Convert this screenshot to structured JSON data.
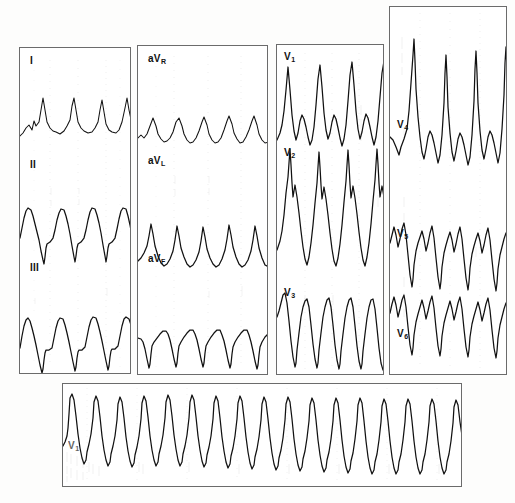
{
  "document": {
    "type": "12-lead electrocardiogram scan",
    "background_color": "#fdfdfc",
    "trace_color": "#111111",
    "panel_border_color": "#6b6b6b",
    "grid_color": "#b9b9b9"
  },
  "panels": [
    {
      "id": "limb-leads",
      "name": "panel-limb-leads",
      "x": 19,
      "y": 47,
      "width": 112,
      "height": 327,
      "leads": [
        {
          "label": "I",
          "sub": "",
          "label_x": 10,
          "label_y": 8,
          "strip_y": 75
        },
        {
          "label": "II",
          "sub": "",
          "label_x": 10,
          "label_y": 112,
          "strip_y": 185
        },
        {
          "label": "III",
          "sub": "",
          "label_x": 10,
          "label_y": 215,
          "strip_y": 285
        }
      ]
    },
    {
      "id": "augmented-leads",
      "name": "panel-augmented-leads",
      "x": 137,
      "y": 45,
      "width": 131,
      "height": 330,
      "leads": [
        {
          "label": "aV",
          "sub": "R",
          "label_x": 10,
          "label_y": 8,
          "strip_y": 82
        },
        {
          "label": "aV",
          "sub": "L",
          "label_x": 10,
          "label_y": 110,
          "strip_y": 190
        },
        {
          "label": "aV",
          "sub": "F",
          "label_x": 10,
          "label_y": 208,
          "strip_y": 288
        }
      ]
    },
    {
      "id": "precordial-leads-v1-v3",
      "name": "panel-precordial-v1-v3",
      "x": 276,
      "y": 44,
      "width": 108,
      "height": 331,
      "leads": [
        {
          "label": "V",
          "sub": "1",
          "label_x": 7,
          "label_y": 7,
          "strip_y": 78
        },
        {
          "label": "V",
          "sub": "2",
          "label_x": 7,
          "label_y": 103,
          "strip_y": 175
        },
        {
          "label": "V",
          "sub": "3",
          "label_x": 7,
          "label_y": 243,
          "strip_y": 300
        }
      ]
    },
    {
      "id": "precordial-leads-v4-v6",
      "name": "panel-precordial-v4-v6",
      "x": 389,
      "y": 6,
      "width": 118,
      "height": 369,
      "leads": [
        {
          "label": "V",
          "sub": "4",
          "label_x": 7,
          "label_y": 113,
          "strip_y": 112
        },
        {
          "label": "V",
          "sub": "5",
          "label_x": 7,
          "label_y": 222,
          "strip_y": 228
        },
        {
          "label": "V",
          "sub": "6",
          "label_x": 7,
          "label_y": 322,
          "strip_y": 320
        }
      ]
    },
    {
      "id": "rhythm-strip",
      "name": "panel-rhythm-strip",
      "x": 62,
      "y": 383,
      "width": 400,
      "height": 104,
      "leads": [
        {
          "label": "V",
          "sub": "1",
          "label_x": 5,
          "label_y": 57,
          "strip_y": 62
        }
      ]
    }
  ],
  "chart_data": {
    "type": "line",
    "xlabel": "time",
    "ylabel": "voltage",
    "grid": true,
    "legend": "none",
    "series": [
      {
        "name": "I",
        "panel": "limb-leads",
        "beats": 4,
        "morphology": "low-amplitude complexes with upright R waves on sloping baseline"
      },
      {
        "name": "II",
        "panel": "limb-leads",
        "beats": 4,
        "morphology": "broad tall positive deflections with deep sharp downstrokes"
      },
      {
        "name": "III",
        "panel": "limb-leads",
        "beats": 4,
        "morphology": "broad tall positive deflections with deep sharp downstrokes"
      },
      {
        "name": "aVR",
        "panel": "augmented-leads",
        "beats": 5,
        "morphology": "small notched upright complexes, low amplitude"
      },
      {
        "name": "aVL",
        "panel": "augmented-leads",
        "beats": 5,
        "morphology": "peaked upright complexes of moderate amplitude"
      },
      {
        "name": "aVF",
        "panel": "augmented-leads",
        "beats": 5,
        "morphology": "wide rounded positive complexes with deep narrow downstrokes"
      },
      {
        "name": "V1",
        "panel": "precordial-v1-v3",
        "beats": 4,
        "morphology": "tall narrow R waves with deep S waves, overlapping adjacent trace"
      },
      {
        "name": "V2",
        "panel": "precordial-v1-v3",
        "beats": 4,
        "morphology": "very tall overlapping complexes extending beyond channel"
      },
      {
        "name": "V3",
        "panel": "precordial-v1-v3",
        "beats": 4,
        "morphology": "deep broad negative complexes"
      },
      {
        "name": "V4",
        "panel": "precordial-v4-v6",
        "beats": 4,
        "morphology": "very tall spiked R waves with sharp peaks"
      },
      {
        "name": "V5",
        "panel": "precordial-v4-v6",
        "beats": 4,
        "morphology": "notched complexes with deep S waves"
      },
      {
        "name": "V6",
        "panel": "precordial-v4-v6",
        "beats": 4,
        "morphology": "notched complexes with deep wide S waves"
      },
      {
        "name": "V1-rhythm",
        "panel": "rhythm-strip",
        "beats": 16,
        "morphology": "regular wide tachycardic complexes, tall R with deep S, continuous run"
      }
    ]
  }
}
